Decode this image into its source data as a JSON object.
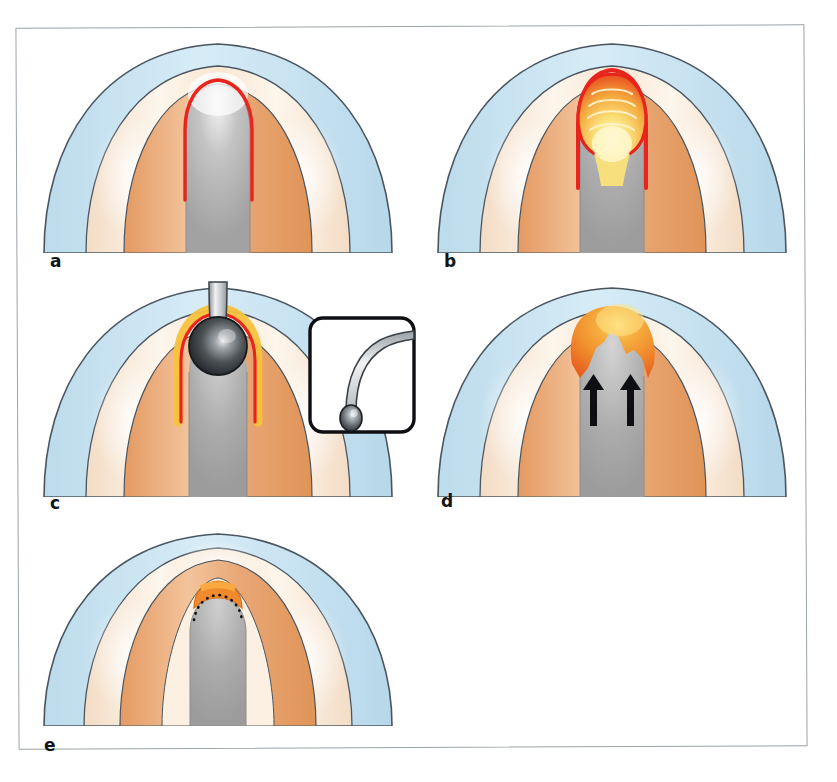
{
  "figure": {
    "panel_count": 5,
    "background_color": "#ffffff",
    "frame_color": "#9aa3a8"
  },
  "palette": {
    "outline": "#4a5560",
    "mucosa_blue": "#bfdcec",
    "mucosa_blue_light": "#d9ecf6",
    "submucosa_cream": "#f7e4d0",
    "submucosa_cream_light": "#fdf5ea",
    "muscle_orange": "#e9a877",
    "muscle_orange_light": "#f3c69f",
    "lumen_gray": "#a8a8a8",
    "lumen_gray_light": "#d2d2d2",
    "marker_red": "#e8241c",
    "marker_yellow": "#fbe27a",
    "marker_orange": "#f08a2c",
    "probe_dark": "#2f3338",
    "probe_light": "#d8dadd",
    "arrow_black": "#0d0f12"
  },
  "panels": [
    {
      "id": "a",
      "label": "a",
      "caption_letter": "a",
      "description": "Baseline cross-section: red outlined bulb-shaped (keyhole) region delineated at the apex of the central gray lumen.",
      "markers": [
        {
          "name": "red-outline-bulb",
          "color": "#e8241c",
          "filled": false
        }
      ]
    },
    {
      "id": "b",
      "label": "b",
      "caption_letter": "b",
      "description": "Distended bulb: red-rimmed cavity filled with graded yellow-orange showing concentric arc ridges.",
      "markers": [
        {
          "name": "red-rim",
          "color": "#e8241c",
          "filled": true
        },
        {
          "name": "yellow-ridged-fill",
          "color": "#fbe27a",
          "filled": true,
          "ridge_count": 4
        }
      ]
    },
    {
      "id": "c",
      "label": "c",
      "caption_letter": "c",
      "description": "Ball-tipped probe advanced into the apex; dark metallic sphere seated in the cavity ringed by red and yellow. Inset shows the curved olive-tipped bougie.",
      "markers": [
        {
          "name": "probe-sphere",
          "color": "#2f3338",
          "filled": true
        },
        {
          "name": "probe-shaft",
          "color": "#d8dadd",
          "filled": true
        },
        {
          "name": "red-rim",
          "color": "#e8241c",
          "filled": false
        },
        {
          "name": "yellow-rim",
          "color": "#fbe27a",
          "filled": false
        }
      ],
      "inset": {
        "name": "ball-tipped-probe-inset",
        "description": "Curved instrument shaft with spherical olive tip",
        "border_color": "#0d0f12",
        "background": "#ffffff"
      }
    },
    {
      "id": "d",
      "label": "d",
      "caption_letter": "d",
      "description": "Orange mass with irregular notched inferior border; two black arrows point superiorly toward the defect.",
      "markers": [
        {
          "name": "orange-mass",
          "color": "#f08a2c",
          "filled": true
        },
        {
          "name": "arrow-left",
          "color": "#0d0f12",
          "direction": "up"
        },
        {
          "name": "arrow-right",
          "color": "#0d0f12",
          "direction": "up"
        }
      ]
    },
    {
      "id": "e",
      "label": "e",
      "caption_letter": "e",
      "description": "Final state: narrow residual orange cap at the apex with a black dotted line marking the previous outline; lumen narrowed to a point.",
      "markers": [
        {
          "name": "orange-cap",
          "color": "#f08a2c",
          "filled": true
        },
        {
          "name": "dotted-outline",
          "color": "#0d0f12",
          "style": "dotted"
        }
      ]
    }
  ]
}
